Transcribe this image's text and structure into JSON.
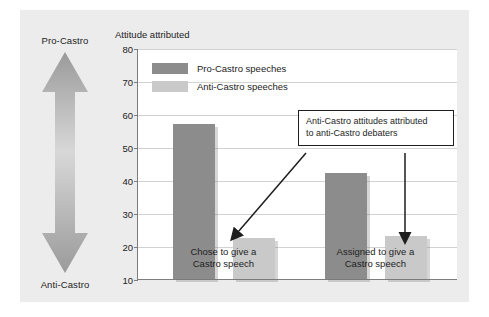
{
  "chart_data": {
    "type": "bar",
    "title": "Attitude attributed",
    "xlabel": "",
    "ylabel": "Attitude attributed",
    "ylim": [
      10,
      80
    ],
    "yticks": [
      10,
      20,
      30,
      40,
      50,
      60,
      70,
      80
    ],
    "grid": true,
    "legend_position": "top-left inside plot",
    "categories": [
      "Chose to give a Castro speech",
      "Assigned to give a Castro speech"
    ],
    "series": [
      {
        "name": "Pro-Castro speeches",
        "values": [
          57,
          42
        ],
        "color": "#8c8c8c"
      },
      {
        "name": "Anti-Castro speeches",
        "values": [
          22.5,
          23
        ],
        "color": "#c9c9c9"
      }
    ],
    "annotations": [
      {
        "text": "Anti-Castro attitudes attributed to anti-Castro debaters",
        "points_to": [
          "Anti-Castro speeches / Chose to give a Castro speech",
          "Anti-Castro speeches / Assigned to give a Castro speech"
        ]
      }
    ],
    "scale_axis": {
      "top_label": "Pro-Castro",
      "bottom_label": "Anti-Castro"
    }
  },
  "chart": {
    "title": "Attitude attributed",
    "y_ticks": [
      "80",
      "70",
      "60",
      "50",
      "40",
      "30",
      "20",
      "10"
    ],
    "x_labels": [
      {
        "line1": "Chose to give a",
        "line2": "Castro speech"
      },
      {
        "line1": "Assigned to give a",
        "line2": "Castro speech"
      }
    ]
  },
  "legend": {
    "items": [
      {
        "label": "Pro-Castro speeches"
      },
      {
        "label": "Anti-Castro speeches"
      }
    ]
  },
  "callout": {
    "line1": "Anti-Castro attitudes attributed",
    "line2": "to anti-Castro debaters"
  },
  "scale": {
    "top_label": "Pro-Castro",
    "bottom_label": "Anti-Castro"
  },
  "colors": {
    "series_pro": "#8c8c8c",
    "series_anti": "#c9c9c9",
    "panel_bg": "#ececec",
    "plot_bg": "#ffffff",
    "grid": "#d2d2d2",
    "axis": "#7d7d7d",
    "text": "#232323"
  }
}
